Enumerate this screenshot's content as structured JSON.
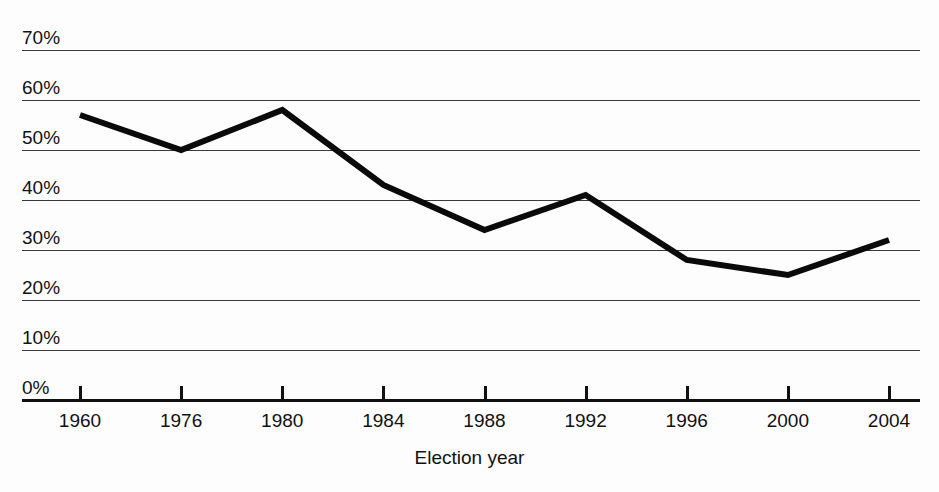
{
  "chart_data": {
    "type": "line",
    "title": "",
    "subtitle": "",
    "xlabel": "Election year",
    "ylabel": "",
    "categories": [
      "1960",
      "1976",
      "1980",
      "1984",
      "1988",
      "1992",
      "1996",
      "2000",
      "2004"
    ],
    "values": [
      57,
      50,
      58,
      43,
      34,
      41,
      28,
      25,
      32
    ],
    "series": [
      {
        "name": "Turnout",
        "values": [
          57,
          50,
          58,
          43,
          34,
          41,
          28,
          25,
          32
        ]
      }
    ],
    "ylim": [
      0,
      70
    ],
    "ytick_values": [
      0,
      10,
      20,
      30,
      40,
      50,
      60,
      70
    ],
    "ytick_labels": [
      "0%",
      "10%",
      "20%",
      "30%",
      "40%",
      "50%",
      "60%",
      "70%"
    ],
    "xtick_labels": [
      "1960",
      "1976",
      "1980",
      "1984",
      "1988",
      "1992",
      "1996",
      "2000",
      "2004"
    ],
    "grid": "horizontal",
    "legend": "none",
    "line_color": "#0a0a0a",
    "grid_color": "#3a3a3a",
    "axis_color": "#111111",
    "background_color": "#fdfdfd",
    "annotations": []
  },
  "axes": {
    "x_axis_title": "Election year"
  }
}
